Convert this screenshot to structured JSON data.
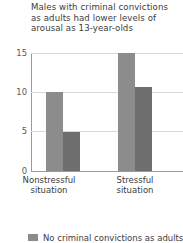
{
  "chart_data": {
    "type": "bar",
    "title": "Males with criminal convictions as adults had lower levels of arousal as 13-year-olds",
    "title_lines": [
      "Males with criminal convictions",
      "as adults had lower levels of",
      "arousal as 13-year-olds"
    ],
    "categories": [
      "Nonstressful situation",
      "Stressful situation"
    ],
    "category_lines": [
      [
        "Nonstressful",
        "situation"
      ],
      [
        "Stressful",
        "situation"
      ]
    ],
    "series": [
      {
        "name": "No criminal convictions as adults",
        "values": [
          10,
          15
        ],
        "color": "#8c8c8c"
      },
      {
        "name": "Criminal convictions as adults",
        "values": [
          5,
          10.7
        ],
        "color": "#6e6e6e"
      }
    ],
    "xlabel": "",
    "ylabel": "",
    "ylim": [
      0,
      15
    ],
    "yticks": [
      0,
      5,
      10,
      15
    ],
    "ytick_labels": [
      "0",
      "5",
      "10",
      "15"
    ],
    "grid": true,
    "legend_position": "bottom",
    "legend_clipped": true
  },
  "axis": {
    "y_tick_0": "0",
    "y_tick_5": "5",
    "y_tick_10": "10",
    "y_tick_15": "15"
  },
  "labels": {
    "group1_line1": "Nonstressful",
    "group1_line2": "situation",
    "group2_line1": "Stressful",
    "group2_line2": "situation"
  },
  "title": {
    "line1": "Males with criminal convictions",
    "line2": "as adults had lower levels of",
    "line3": "arousal as 13-year-olds"
  },
  "legend": {
    "series1_label": "No criminal convictions as adults"
  },
  "colors": {
    "series1": "#8c8c8c",
    "series2": "#6e6e6e",
    "grid": "#d8d8d8",
    "axis": "#9a9a9a",
    "text": "#3c3c3c",
    "background": "#ffffff"
  }
}
